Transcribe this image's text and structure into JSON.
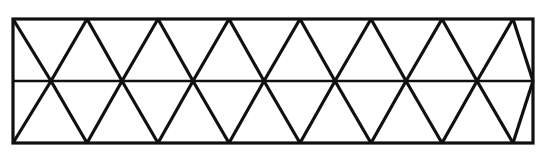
{
  "figure": {
    "canvas": {
      "width": 544,
      "height": 153,
      "background": "#ffffff"
    },
    "style": {
      "stroke_color": "#101010",
      "border_stroke_width": 3.2,
      "diagonal_stroke_width": 3.2,
      "midline_stroke_width": 2.6,
      "fill": "none"
    },
    "rectangle": {
      "left": 13,
      "top": 19,
      "right": 533,
      "bottom": 143,
      "width": 520,
      "height": 124
    },
    "midline": {
      "y": 81,
      "x_start": 13,
      "x_end": 533
    },
    "geometry": {
      "column_spacing": 71.0,
      "half_spacing": 35.5,
      "row_count": 2,
      "triangle_count": 28
    },
    "midline_crossings_x": [
      51,
      122,
      193,
      264,
      335,
      406,
      477
    ],
    "top_apexes_x": [
      87,
      158,
      229,
      300,
      371,
      442,
      513
    ],
    "bottom_apexes_x": [
      87,
      158,
      229,
      300,
      371,
      442,
      513
    ],
    "upper_band": {
      "note": "Upper row: downward-pointing triangles with apex on the midline and base on the top edge; upward triangles have apex on the top edge and base on the midline.",
      "down_lines": [
        {
          "x1": 13,
          "y1": 19,
          "x2": 51,
          "y2": 81
        },
        {
          "x1": 87,
          "y1": 19,
          "x2": 51,
          "y2": 81
        },
        {
          "x1": 87,
          "y1": 19,
          "x2": 122,
          "y2": 81
        },
        {
          "x1": 158,
          "y1": 19,
          "x2": 122,
          "y2": 81
        },
        {
          "x1": 158,
          "y1": 19,
          "x2": 193,
          "y2": 81
        },
        {
          "x1": 229,
          "y1": 19,
          "x2": 193,
          "y2": 81
        },
        {
          "x1": 229,
          "y1": 19,
          "x2": 264,
          "y2": 81
        },
        {
          "x1": 300,
          "y1": 19,
          "x2": 264,
          "y2": 81
        },
        {
          "x1": 300,
          "y1": 19,
          "x2": 335,
          "y2": 81
        },
        {
          "x1": 371,
          "y1": 19,
          "x2": 335,
          "y2": 81
        },
        {
          "x1": 371,
          "y1": 19,
          "x2": 406,
          "y2": 81
        },
        {
          "x1": 442,
          "y1": 19,
          "x2": 406,
          "y2": 81
        },
        {
          "x1": 442,
          "y1": 19,
          "x2": 477,
          "y2": 81
        },
        {
          "x1": 513,
          "y1": 19,
          "x2": 477,
          "y2": 81
        },
        {
          "x1": 513,
          "y1": 19,
          "x2": 533,
          "y2": 81
        }
      ]
    },
    "lower_band": {
      "note": "Lower row mirrors the upper row: diagonals run from the midline crossings down to the bottom edge apexes.",
      "down_lines": [
        {
          "x1": 13,
          "y1": 143,
          "x2": 51,
          "y2": 81
        },
        {
          "x1": 87,
          "y1": 143,
          "x2": 51,
          "y2": 81
        },
        {
          "x1": 87,
          "y1": 143,
          "x2": 122,
          "y2": 81
        },
        {
          "x1": 158,
          "y1": 143,
          "x2": 122,
          "y2": 81
        },
        {
          "x1": 158,
          "y1": 143,
          "x2": 193,
          "y2": 81
        },
        {
          "x1": 229,
          "y1": 143,
          "x2": 193,
          "y2": 81
        },
        {
          "x1": 229,
          "y1": 143,
          "x2": 264,
          "y2": 81
        },
        {
          "x1": 300,
          "y1": 143,
          "x2": 264,
          "y2": 81
        },
        {
          "x1": 300,
          "y1": 143,
          "x2": 335,
          "y2": 81
        },
        {
          "x1": 371,
          "y1": 143,
          "x2": 335,
          "y2": 81
        },
        {
          "x1": 371,
          "y1": 143,
          "x2": 406,
          "y2": 81
        },
        {
          "x1": 442,
          "y1": 143,
          "x2": 406,
          "y2": 81
        },
        {
          "x1": 442,
          "y1": 143,
          "x2": 477,
          "y2": 81
        },
        {
          "x1": 513,
          "y1": 143,
          "x2": 477,
          "y2": 81
        },
        {
          "x1": 513,
          "y1": 143,
          "x2": 533,
          "y2": 81
        }
      ]
    }
  }
}
